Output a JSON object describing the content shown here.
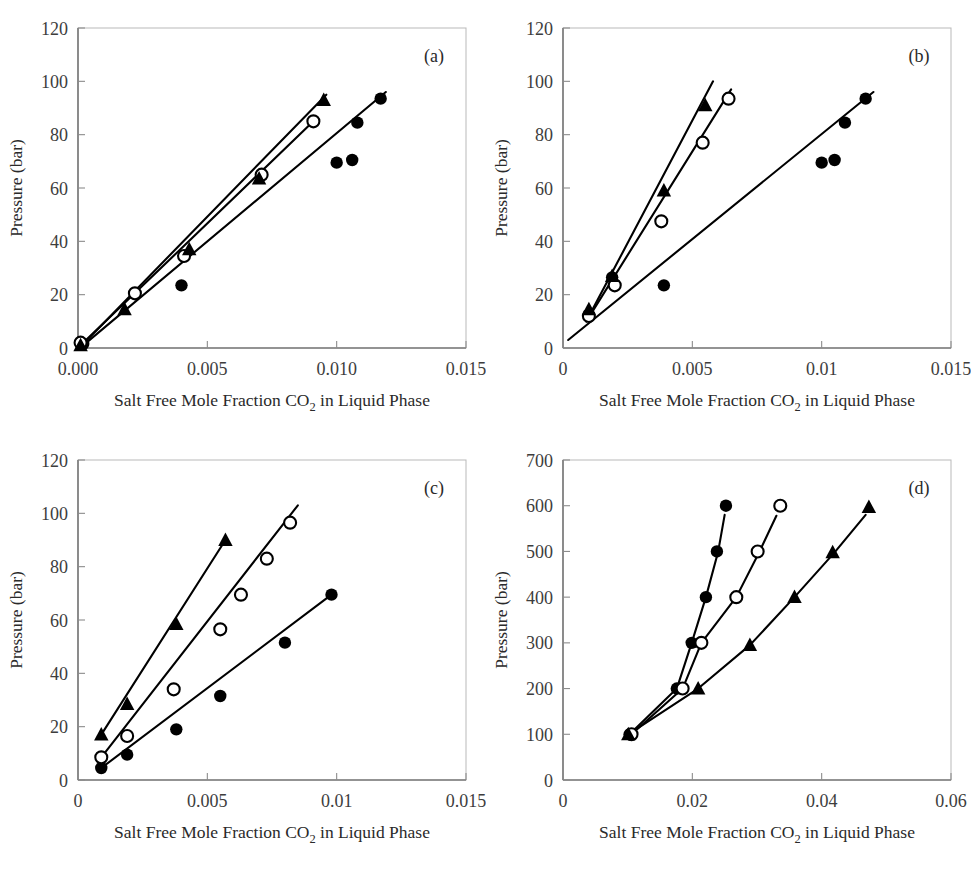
{
  "figure": {
    "title": "",
    "axis_label_x": "Salt Free Mole Fraction CO",
    "axis_label_x_sub": "2",
    "axis_label_x_tail": " in Liquid Phase",
    "axis_label_y": "Pressure (bar)",
    "marker_colors": {
      "filled": "#000000",
      "open_fill": "#ffffff",
      "line": "#000000"
    }
  },
  "chart_data": [
    {
      "id": "a",
      "type": "scatter",
      "panel_label": "(a)",
      "title": "",
      "xlabel": "Salt Free Mole Fraction CO2 in Liquid Phase",
      "ylabel": "Pressure (bar)",
      "xlim": [
        0.0,
        0.015
      ],
      "ylim": [
        0,
        120
      ],
      "xticks": [
        0.0,
        0.005,
        0.01,
        0.015
      ],
      "xticklabels": [
        "0.000",
        "0.005",
        "0.010",
        "0.015"
      ],
      "yticks": [
        0,
        20,
        40,
        60,
        80,
        100,
        120
      ],
      "yticklabels": [
        "0",
        "20",
        "40",
        "60",
        "80",
        "100",
        "120"
      ],
      "grid": false,
      "legend": "none",
      "series": [
        {
          "name": "filled-circle",
          "marker": "filled-circle",
          "x": [
            0.0002,
            0.004,
            0.01,
            0.0106,
            0.0108,
            0.0117
          ],
          "y": [
            1.5,
            23.5,
            69.5,
            70.5,
            84.5,
            93.5
          ]
        },
        {
          "name": "open-circle",
          "marker": "open-circle",
          "x": [
            0.0001,
            0.0022,
            0.0041,
            0.0071,
            0.0091
          ],
          "y": [
            2.0,
            20.5,
            34.5,
            65.0,
            85.0
          ]
        },
        {
          "name": "filled-triangle",
          "marker": "filled-triangle",
          "x": [
            0.0001,
            0.0018,
            0.0043,
            0.007,
            0.0095
          ],
          "y": [
            1.0,
            14.5,
            37.0,
            63.5,
            93.0
          ]
        }
      ],
      "fit_lines": [
        {
          "for": "filled-circle",
          "x": [
            0.0002,
            0.0119
          ],
          "y": [
            1.0,
            96.0
          ]
        },
        {
          "for": "open-circle",
          "x": [
            0.0001,
            0.0091
          ],
          "y": [
            1.0,
            85.0
          ]
        },
        {
          "for": "filled-triangle",
          "x": [
            0.0001,
            0.0096
          ],
          "y": [
            0.5,
            95.0
          ]
        }
      ]
    },
    {
      "id": "b",
      "type": "scatter",
      "panel_label": "(b)",
      "title": "",
      "xlabel": "Salt Free Mole Fraction CO2 in Liquid Phase",
      "ylabel": "Pressure (bar)",
      "xlim": [
        0.0,
        0.015
      ],
      "ylim": [
        0,
        120
      ],
      "xticks": [
        0.0,
        0.005,
        0.01,
        0.015
      ],
      "xticklabels": [
        "0",
        "0.005",
        "0.01",
        "0.015"
      ],
      "yticks": [
        0,
        20,
        40,
        60,
        80,
        100,
        120
      ],
      "yticklabels": [
        "0",
        "20",
        "40",
        "60",
        "80",
        "100",
        "120"
      ],
      "grid": false,
      "legend": "none",
      "series": [
        {
          "name": "filled-circle",
          "marker": "filled-circle",
          "x": [
            0.001,
            0.0019,
            0.0039,
            0.01,
            0.0105,
            0.0109,
            0.0117
          ],
          "y": [
            12.5,
            26.5,
            23.5,
            69.5,
            70.5,
            84.5,
            93.5
          ]
        },
        {
          "name": "open-circle",
          "marker": "open-circle",
          "x": [
            0.001,
            0.002,
            0.0038,
            0.0054,
            0.0064
          ],
          "y": [
            12.0,
            23.5,
            47.5,
            77.0,
            93.5
          ]
        },
        {
          "name": "filled-triangle",
          "marker": "filled-triangle",
          "x": [
            0.001,
            0.0019,
            0.0039,
            0.0055
          ],
          "y": [
            14.5,
            27.0,
            59.0,
            91.0
          ]
        }
      ],
      "fit_lines": [
        {
          "for": "filled-circle",
          "x": [
            0.0002,
            0.012
          ],
          "y": [
            3.0,
            96.0
          ]
        },
        {
          "for": "open-circle",
          "x": [
            0.0009,
            0.0065
          ],
          "y": [
            10.0,
            97.0
          ]
        },
        {
          "for": "filled-triangle",
          "x": [
            0.0009,
            0.0058
          ],
          "y": [
            10.0,
            100.0
          ]
        }
      ]
    },
    {
      "id": "c",
      "type": "scatter",
      "panel_label": "(c)",
      "title": "",
      "xlabel": "Salt Free Mole Fraction CO2 in Liquid Phase",
      "ylabel": "Pressure (bar)",
      "xlim": [
        0.0,
        0.015
      ],
      "ylim": [
        0,
        120
      ],
      "xticks": [
        0.0,
        0.005,
        0.01,
        0.015
      ],
      "xticklabels": [
        "0",
        "0.005",
        "0.01",
        "0.015"
      ],
      "yticks": [
        0,
        20,
        40,
        60,
        80,
        100,
        120
      ],
      "yticklabels": [
        "0",
        "20",
        "40",
        "60",
        "80",
        "100",
        "120"
      ],
      "grid": false,
      "legend": "none",
      "series": [
        {
          "name": "filled-circle",
          "marker": "filled-circle",
          "x": [
            0.0009,
            0.0019,
            0.0038,
            0.0055,
            0.008,
            0.0098
          ],
          "y": [
            4.5,
            9.5,
            19.0,
            31.5,
            51.5,
            69.5
          ]
        },
        {
          "name": "open-circle",
          "marker": "open-circle",
          "x": [
            0.0009,
            0.0019,
            0.0037,
            0.0055,
            0.0063,
            0.0073,
            0.0082
          ],
          "y": [
            8.5,
            16.5,
            34.0,
            56.5,
            69.5,
            83.0,
            96.5
          ]
        },
        {
          "name": "filled-triangle",
          "marker": "filled-triangle",
          "x": [
            0.0009,
            0.0019,
            0.0038,
            0.0057
          ],
          "y": [
            17.0,
            28.5,
            58.5,
            90.0
          ]
        }
      ],
      "fit_lines": [
        {
          "for": "filled-circle",
          "x": [
            0.0009,
            0.0098
          ],
          "y": [
            4.5,
            69.5
          ]
        },
        {
          "for": "open-circle",
          "x": [
            0.0009,
            0.0085
          ],
          "y": [
            8.5,
            103.0
          ]
        },
        {
          "for": "filled-triangle",
          "x": [
            0.0009,
            0.0057
          ],
          "y": [
            17.0,
            90.0
          ]
        }
      ]
    },
    {
      "id": "d",
      "type": "scatter",
      "panel_label": "(d)",
      "title": "",
      "xlabel": "Salt Free Mole Fraction CO2 in Liquid Phase",
      "ylabel": "Pressure (bar)",
      "xlim": [
        0.0,
        0.06
      ],
      "ylim": [
        0,
        700
      ],
      "xticks": [
        0.0,
        0.02,
        0.04,
        0.06
      ],
      "xticklabels": [
        "0",
        "0.02",
        "0.04",
        "0.06"
      ],
      "yticks": [
        0,
        100,
        200,
        300,
        400,
        500,
        600,
        700
      ],
      "yticklabels": [
        "0",
        "100",
        "200",
        "300",
        "400",
        "500",
        "600",
        "700"
      ],
      "grid": false,
      "legend": "none",
      "series": [
        {
          "name": "filled-circle",
          "marker": "filled-circle",
          "x": [
            0.0103,
            0.0176,
            0.0199,
            0.0221,
            0.0238,
            0.0252
          ],
          "y": [
            100,
            200,
            300,
            400,
            500,
            600
          ]
        },
        {
          "name": "open-circle",
          "marker": "open-circle",
          "x": [
            0.0106,
            0.0185,
            0.0214,
            0.0268,
            0.0301,
            0.0336
          ],
          "y": [
            100,
            200,
            300,
            400,
            500,
            600
          ]
        },
        {
          "name": "filled-triangle",
          "marker": "filled-triangle",
          "x": [
            0.0101,
            0.0209,
            0.0289,
            0.0358,
            0.0417,
            0.0473
          ],
          "y": [
            100,
            200,
            295,
            400,
            498,
            597
          ]
        }
      ],
      "fit_lines": [
        {
          "for": "filled-circle",
          "x": [
            0.0103,
            0.0176,
            0.0199,
            0.0221,
            0.024,
            0.025
          ],
          "y": [
            100,
            200,
            300,
            400,
            500,
            580
          ]
        },
        {
          "for": "open-circle",
          "x": [
            0.0106,
            0.0185,
            0.0214,
            0.0268,
            0.0304,
            0.033
          ],
          "y": [
            100,
            200,
            300,
            400,
            500,
            578
          ]
        },
        {
          "for": "filled-triangle",
          "x": [
            0.0101,
            0.0209,
            0.0289,
            0.0358,
            0.042,
            0.0468
          ],
          "y": [
            100,
            200,
            295,
            400,
            498,
            580
          ]
        }
      ]
    }
  ]
}
